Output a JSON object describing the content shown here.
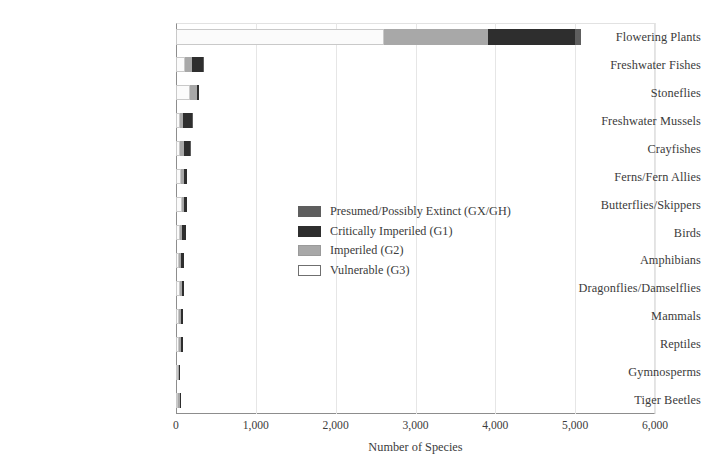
{
  "chart_data": {
    "type": "bar",
    "subtype": "stacked-horizontal",
    "title": "",
    "xlabel": "Number of Species",
    "ylabel": "",
    "xlim": [
      0,
      6000
    ],
    "ylim": null,
    "grid": "vertical",
    "legend_position": "inside-center",
    "xticks": [
      "0",
      "1,000",
      "2,000",
      "3,000",
      "4,000",
      "5,000",
      "6,000"
    ],
    "xtick_values": [
      0,
      1000,
      2000,
      3000,
      4000,
      5000,
      6000
    ],
    "categories": [
      "Flowering Plants",
      "Freshwater Fishes",
      "Stoneflies",
      "Freshwater Mussels",
      "Crayfishes",
      "Ferns/Fern Allies",
      "Butterflies/Skippers",
      "Birds",
      "Amphibians",
      "Dragonflies/Damselflies",
      "Mammals",
      "Reptiles",
      "Gymnosperms",
      "Tiger Beetles"
    ],
    "series": [
      {
        "name": "Vulnerable (G3)",
        "key": "g3",
        "color": "#fbfbfb",
        "values": [
          2610,
          110,
          175,
          50,
          45,
          60,
          70,
          50,
          40,
          45,
          35,
          40,
          20,
          20
        ]
      },
      {
        "name": "Imperiled (G2)",
        "key": "g2",
        "color": "#a8a8a8",
        "values": [
          1300,
          90,
          85,
          40,
          50,
          35,
          35,
          30,
          25,
          25,
          25,
          25,
          15,
          20
        ]
      },
      {
        "name": "Critically Imperiled (G1)",
        "key": "g1",
        "color": "#2e2e2e",
        "values": [
          1090,
          140,
          30,
          105,
          80,
          45,
          30,
          40,
          40,
          30,
          25,
          20,
          15,
          15
        ]
      },
      {
        "name": "Presumed/Possibly Extinct (GX/GH)",
        "key": "gx",
        "color": "#5e5e5e",
        "values": [
          75,
          5,
          0,
          10,
          5,
          0,
          0,
          0,
          0,
          0,
          0,
          0,
          0,
          0
        ]
      }
    ],
    "totals": [
      5075,
      345,
      290,
      205,
      180,
      140,
      135,
      120,
      105,
      100,
      85,
      85,
      50,
      55
    ]
  },
  "legend": {
    "items": [
      {
        "label": "Presumed/Possibly Extinct (GX/GH)",
        "key": "gx"
      },
      {
        "label": "Critically Imperiled (G1)",
        "key": "g1"
      },
      {
        "label": "Imperiled (G2)",
        "key": "g2"
      },
      {
        "label": "Vulnerable (G3)",
        "key": "g3"
      }
    ]
  },
  "colors": {
    "gx": "#5e5e5e",
    "g1": "#2e2e2e",
    "g2": "#a8a8a8",
    "g3": "#fbfbfb",
    "axis": "#8d8d8d",
    "grid": "#e6e6e6",
    "text": "#3b3b3b"
  }
}
